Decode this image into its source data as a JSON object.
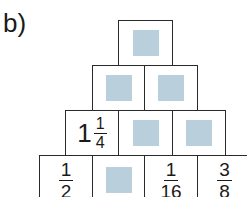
{
  "exercise": {
    "label": "b)"
  },
  "pyramid": {
    "blank_color": "#b9cfdc",
    "rows": [
      [
        {
          "type": "blank"
        }
      ],
      [
        {
          "type": "blank"
        },
        {
          "type": "blank"
        }
      ],
      [
        {
          "type": "mixed",
          "whole": "1",
          "num": "1",
          "den": "4"
        },
        {
          "type": "blank"
        },
        {
          "type": "blank"
        }
      ],
      [
        {
          "type": "fraction",
          "num": "1",
          "den": "2"
        },
        {
          "type": "blank"
        },
        {
          "type": "fraction",
          "num": "1",
          "den": "16"
        },
        {
          "type": "fraction",
          "num": "3",
          "den": "8"
        }
      ]
    ]
  }
}
